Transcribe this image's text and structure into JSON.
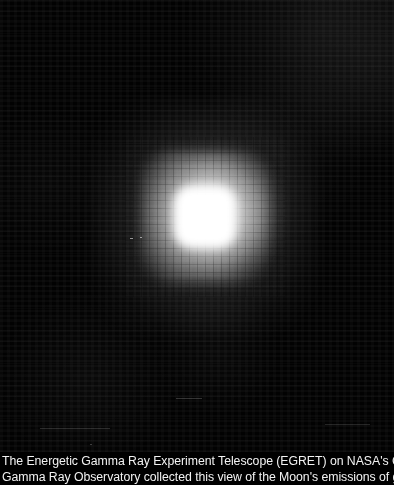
{
  "image": {
    "alt_name": "egret-moon-gamma-ray-view",
    "subject": "Moon",
    "background_color": "#000000",
    "core_color": "#ffffff",
    "halo_color": "#ffffff",
    "source_center": {
      "x": 205,
      "y": 217
    }
  },
  "caption": {
    "line1": "The Energetic Gamma Ray Experiment Telescope (EGRET) on NASA's Compton",
    "line2": "Gamma Ray Observatory collected this view of the Moon's emissions of gamma",
    "text_color": "#f2f2f2"
  }
}
